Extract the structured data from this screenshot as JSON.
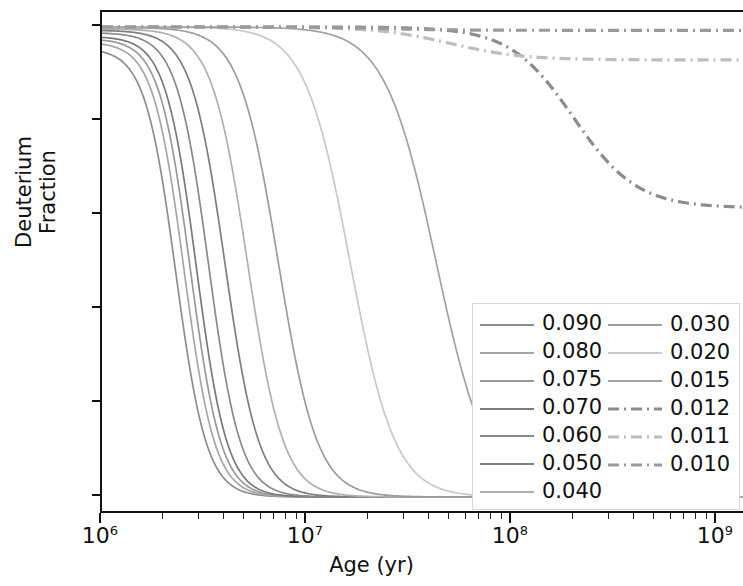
{
  "chart_data": {
    "type": "line",
    "title": "",
    "xlabel": "Age (yr)",
    "ylabel": "Deuterium Fraction",
    "xscale": "log",
    "yscale": "linear",
    "xlim": [
      1000000,
      2500000000
    ],
    "ylim": [
      -0.03,
      1.03
    ],
    "xticks": [
      "10^6",
      "10^7",
      "10^8",
      "10^9"
    ],
    "xtick_labels": [
      "10⁶",
      "10⁷",
      "10⁸",
      "10⁹"
    ],
    "yticks": [
      0.0,
      0.2,
      0.4,
      0.6,
      0.8,
      1.0
    ],
    "ytick_labels": [
      "0.0",
      "0.2",
      "0.4",
      "0.6",
      "0.8",
      "1.0"
    ],
    "grid": false,
    "legend_position": "lower right",
    "legend_columns": 2,
    "series": [
      {
        "name": "0.090",
        "color": "#8e8e8e",
        "dash": "solid",
        "start_y": 0.955,
        "drop_center_log": 6.36,
        "drop_width": 0.3,
        "floor": 0.0
      },
      {
        "name": "0.080",
        "color": "#a6a6a6",
        "dash": "solid",
        "start_y": 0.968,
        "drop_center_log": 6.4,
        "drop_width": 0.3,
        "floor": 0.0
      },
      {
        "name": "0.075",
        "color": "#999999",
        "dash": "solid",
        "start_y": 0.975,
        "drop_center_log": 6.43,
        "drop_width": 0.3,
        "floor": 0.0
      },
      {
        "name": "0.070",
        "color": "#7a7a7a",
        "dash": "solid",
        "start_y": 0.98,
        "drop_center_log": 6.46,
        "drop_width": 0.3,
        "floor": 0.0
      },
      {
        "name": "0.060",
        "color": "#8a8a8a",
        "dash": "solid",
        "start_y": 0.988,
        "drop_center_log": 6.52,
        "drop_width": 0.31,
        "floor": 0.0
      },
      {
        "name": "0.050",
        "color": "#7e7e7e",
        "dash": "solid",
        "start_y": 0.993,
        "drop_center_log": 6.6,
        "drop_width": 0.33,
        "floor": 0.0
      },
      {
        "name": "0.040",
        "color": "#b0b0b0",
        "dash": "solid",
        "start_y": 0.996,
        "drop_center_log": 6.71,
        "drop_width": 0.35,
        "floor": 0.0
      },
      {
        "name": "0.030",
        "color": "#9c9c9c",
        "dash": "solid",
        "start_y": 0.999,
        "drop_center_log": 6.86,
        "drop_width": 0.38,
        "floor": 0.0
      },
      {
        "name": "0.020",
        "color": "#c9c9c9",
        "dash": "solid",
        "start_y": 1.0,
        "drop_center_log": 7.21,
        "drop_width": 0.44,
        "floor": 0.0
      },
      {
        "name": "0.015",
        "color": "#a2a2a2",
        "dash": "solid",
        "start_y": 1.0,
        "drop_center_log": 7.63,
        "drop_width": 0.5,
        "floor": 0.0
      },
      {
        "name": "0.012",
        "color": "#8c8c8c",
        "dash": "dashdot",
        "start_y": 1.0,
        "drop_center_log": 8.3,
        "drop_width": 0.62,
        "floor": 0.615
      },
      {
        "name": "0.011",
        "color": "#bdbdbd",
        "dash": "dashdot",
        "start_y": 1.0,
        "drop_center_log": 7.7,
        "drop_width": 0.7,
        "floor": 0.93
      },
      {
        "name": "0.010",
        "color": "#9a9a9a",
        "dash": "dashdot",
        "start_y": 1.0,
        "drop_center_log": 7.4,
        "drop_width": 0.6,
        "floor": 0.993
      }
    ]
  },
  "axes": {
    "ylabel": "Deuterium Fraction",
    "xlabel": "Age (yr)",
    "ytick_labels": [
      "1.0",
      "0.8",
      "0.6",
      "0.4",
      "0.2",
      "0.0"
    ],
    "xtick_mantissa": "10",
    "xtick_exponents": [
      "6",
      "7",
      "8",
      "9"
    ]
  },
  "legend": {
    "left_column": [
      "0.090",
      "0.080",
      "0.075",
      "0.070",
      "0.060",
      "0.050",
      "0.040"
    ],
    "right_column": [
      "0.030",
      "0.020",
      "0.015",
      "0.012",
      "0.011",
      "0.010"
    ]
  }
}
